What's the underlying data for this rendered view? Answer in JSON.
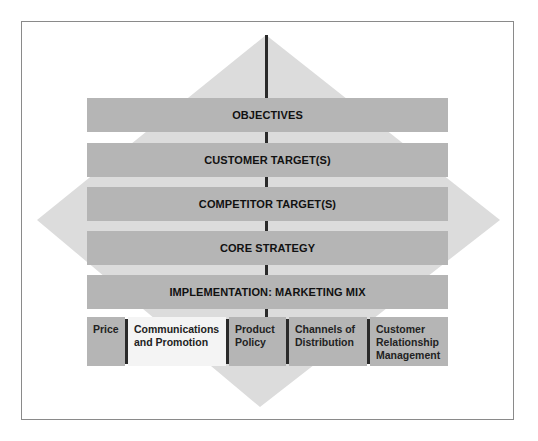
{
  "diagram": {
    "colors": {
      "diamond": "#dcdcdc",
      "band": "#b5b5b5",
      "spine": "#2a2a2a",
      "highlight_cell": "#f4f4f4"
    },
    "bands": [
      {
        "label": "OBJECTIVES"
      },
      {
        "label": "CUSTOMER TARGET(S)"
      },
      {
        "label": "COMPETITOR TARGET(S)"
      },
      {
        "label": "CORE STRATEGY"
      },
      {
        "label": "IMPLEMENTATION: MARKETING MIX"
      }
    ],
    "marketing_mix": [
      {
        "label": "Price",
        "highlighted": false
      },
      {
        "label": "Communications and Promotion",
        "highlighted": true
      },
      {
        "label": "Product Policy",
        "highlighted": false
      },
      {
        "label": "Channels of Distribution",
        "highlighted": false
      },
      {
        "label": "Customer Relationship Management",
        "highlighted": false
      }
    ]
  }
}
